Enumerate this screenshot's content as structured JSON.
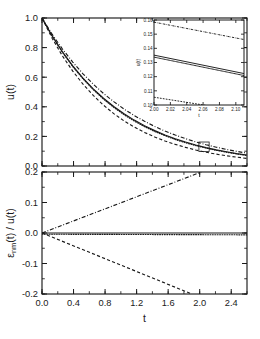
{
  "figure": {
    "title": "",
    "xlabel": "t",
    "panels": [
      {
        "id": "upper",
        "ylabel": "u(t)",
        "ylabel_parts": {
          "main": "u(t)"
        }
      },
      {
        "id": "lower",
        "ylabel": "εnm(t) / u(t)",
        "ylabel_parts": {
          "eps": "ε",
          "sub": "nm",
          "rest": "(t) / u(t)"
        }
      }
    ]
  },
  "chart_data": [
    {
      "id": "upper-panel",
      "type": "line",
      "title": "",
      "xlabel": "",
      "ylabel": "u(t)",
      "xlim": [
        0.0,
        2.6
      ],
      "ylim": [
        0.0,
        1.0
      ],
      "xticks": [
        0.0,
        0.4,
        0.8,
        1.2,
        1.6,
        2.0,
        2.4
      ],
      "xticklabels": [
        "",
        "",
        "",
        "",
        "",
        "",
        ""
      ],
      "yticks": [
        0.0,
        0.2,
        0.4,
        0.6,
        0.8,
        1.0
      ],
      "yticklabels": [
        "0.0",
        "0.2",
        "0.4",
        "0.6",
        "0.8",
        "1.0"
      ],
      "minor_tick_step_x": 0.2,
      "minor_tick_step_y": 0.1,
      "grid": false,
      "legend": "none",
      "annotations": [
        {
          "type": "rect",
          "name": "inset-region-marker",
          "x0": 1.99,
          "x1": 2.12,
          "y0": 0.098,
          "y1": 0.162
        }
      ],
      "series": [
        {
          "name": "dash-dot",
          "linestyle": "dashdot",
          "x": [
            0.0,
            0.13,
            0.26,
            0.39,
            0.52,
            0.65,
            0.78,
            0.91,
            1.04,
            1.17,
            1.3,
            1.43,
            1.56,
            1.69,
            1.82,
            1.95,
            2.08,
            2.21,
            2.34,
            2.47,
            2.6
          ],
          "y": [
            1.0,
            0.889,
            0.79,
            0.702,
            0.623,
            0.553,
            0.49,
            0.435,
            0.385,
            0.341,
            0.302,
            0.267,
            0.236,
            0.209,
            0.185,
            0.163,
            0.144,
            0.127,
            0.112,
            0.099,
            0.087
          ]
        },
        {
          "name": "solid",
          "linestyle": "solid",
          "x": [
            0.0,
            0.13,
            0.26,
            0.39,
            0.52,
            0.65,
            0.78,
            0.91,
            1.04,
            1.17,
            1.3,
            1.43,
            1.56,
            1.69,
            1.82,
            1.95,
            2.08,
            2.21,
            2.34,
            2.47,
            2.6
          ],
          "y": [
            1.0,
            0.878,
            0.771,
            0.677,
            0.594,
            0.521,
            0.458,
            0.402,
            0.353,
            0.31,
            0.272,
            0.239,
            0.21,
            0.184,
            0.162,
            0.142,
            0.124,
            0.109,
            0.096,
            0.084,
            0.074
          ]
        },
        {
          "name": "dotted",
          "linestyle": "dotted",
          "x": [
            0.0,
            0.13,
            0.26,
            0.39,
            0.52,
            0.65,
            0.78,
            0.91,
            1.04,
            1.17,
            1.3,
            1.43,
            1.56,
            1.69,
            1.82,
            1.95,
            2.08,
            2.21,
            2.34,
            2.47,
            2.6
          ],
          "y": [
            1.0,
            0.876,
            0.767,
            0.672,
            0.589,
            0.516,
            0.452,
            0.396,
            0.347,
            0.304,
            0.266,
            0.233,
            0.205,
            0.179,
            0.157,
            0.138,
            0.121,
            0.106,
            0.093,
            0.081,
            0.071
          ]
        },
        {
          "name": "dashed",
          "linestyle": "dashed",
          "x": [
            0.0,
            0.13,
            0.26,
            0.39,
            0.52,
            0.65,
            0.78,
            0.91,
            1.04,
            1.17,
            1.3,
            1.43,
            1.56,
            1.69,
            1.82,
            1.95,
            2.08,
            2.21,
            2.34,
            2.47,
            2.6
          ],
          "y": [
            1.0,
            0.862,
            0.743,
            0.641,
            0.553,
            0.477,
            0.411,
            0.354,
            0.305,
            0.263,
            0.227,
            0.196,
            0.169,
            0.146,
            0.126,
            0.108,
            0.093,
            0.08,
            0.069,
            0.06,
            0.051
          ]
        }
      ]
    },
    {
      "id": "inset-panel",
      "type": "line",
      "title": "",
      "xlabel": "t",
      "ylabel": "u(t)",
      "xlim": [
        2.0,
        2.11
      ],
      "ylim": [
        0.1,
        0.16
      ],
      "xticks": [
        2.0,
        2.02,
        2.04,
        2.06,
        2.08,
        2.1
      ],
      "xticklabels": [
        "2.00",
        "2.02",
        "2.04",
        "2.06",
        "2.08",
        "2.10"
      ],
      "yticks": [
        0.1,
        0.11,
        0.12,
        0.13,
        0.14,
        0.15,
        0.16
      ],
      "yticklabels": [
        "0.10",
        "0.11",
        "0.12",
        "0.13",
        "0.14",
        "0.15",
        "0.16"
      ],
      "grid": false,
      "legend": "none",
      "series": [
        {
          "name": "dash-dot",
          "linestyle": "dashdot",
          "x": [
            2.0,
            2.11
          ],
          "y": [
            0.1585,
            0.1462
          ]
        },
        {
          "name": "solid",
          "linestyle": "solid",
          "x": [
            2.0,
            2.11
          ],
          "y": [
            0.1352,
            0.1222
          ]
        },
        {
          "name": "dotted",
          "linestyle": "dotted",
          "x": [
            2.0,
            2.11
          ],
          "y": [
            0.1338,
            0.1208
          ]
        },
        {
          "name": "dashed",
          "linestyle": "dashed",
          "x": [
            2.0,
            2.11
          ],
          "y": [
            0.1055,
            0.0955
          ]
        }
      ]
    },
    {
      "id": "lower-panel",
      "type": "line",
      "title": "",
      "xlabel": "t",
      "ylabel": "εnm(t) / u(t)",
      "xlim": [
        0.0,
        2.6
      ],
      "ylim": [
        -0.2,
        0.2
      ],
      "xticks": [
        0.0,
        0.4,
        0.8,
        1.2,
        1.6,
        2.0,
        2.4
      ],
      "xticklabels": [
        "0.0",
        "0.4",
        "0.8",
        "1.2",
        "1.6",
        "2.0",
        "2.4"
      ],
      "yticks": [
        -0.2,
        -0.1,
        0.0,
        0.1,
        0.2
      ],
      "yticklabels": [
        "-0.2",
        "-0.1",
        "0.0",
        "0.1",
        "0.2"
      ],
      "minor_tick_step_x": 0.2,
      "minor_tick_step_y": 0.05,
      "grid": false,
      "legend": "none",
      "series": [
        {
          "name": "dash-dot",
          "linestyle": "dashdot",
          "x": [
            0.0,
            2.02
          ],
          "y": [
            0.0,
            0.2
          ]
        },
        {
          "name": "solid",
          "linestyle": "solid",
          "x": [
            0.0,
            2.6
          ],
          "y": [
            0.0,
            0.0
          ]
        },
        {
          "name": "dotted",
          "linestyle": "dotted",
          "x": [
            0.0,
            2.6
          ],
          "y": [
            -0.004,
            -0.006
          ]
        },
        {
          "name": "dashed",
          "linestyle": "dashed",
          "x": [
            0.0,
            1.9
          ],
          "y": [
            0.0,
            -0.2
          ]
        }
      ]
    }
  ]
}
